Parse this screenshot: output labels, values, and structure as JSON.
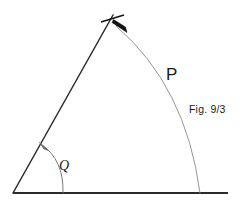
{
  "figure": {
    "caption": "Fig. 9/3",
    "labels": {
      "arc_label": "P",
      "angle_label": "Q"
    },
    "colors": {
      "background": "#ffffff",
      "baseline_stroke": "#2b2b2b",
      "slant_stroke": "#2b2b2b",
      "arc_stroke": "#8a8a8a",
      "angle_arc_stroke": "#6b6b6b",
      "marker_fill": "#111111",
      "text": "#1a1a1a"
    },
    "geometry": {
      "origin": {
        "x": 13,
        "y": 193
      },
      "apex": {
        "x": 113,
        "y": 15
      },
      "baseline_end": {
        "x": 228,
        "y": 193
      },
      "arc_start": {
        "x": 116,
        "y": 26
      },
      "arc_end": {
        "x": 200,
        "y": 193
      },
      "arc_control": {
        "x": 186,
        "y": 86
      },
      "angle_arc_start": {
        "x": 63,
        "y": 193
      },
      "angle_arc_end": {
        "x": 42,
        "y": 145
      },
      "angle_arc_control": {
        "x": 64,
        "y": 160
      },
      "apex_tick_start": {
        "x": 101,
        "y": 22
      },
      "apex_tick_end": {
        "x": 124,
        "y": 15
      },
      "apex_arrow_tip": {
        "x": 126,
        "y": 32
      },
      "angle_arrow_tip": {
        "x": 40,
        "y": 143
      }
    },
    "strokes": {
      "baseline_width": 2.1,
      "slant_width": 1.5,
      "arc_width": 0.9,
      "angle_arc_width": 0.9,
      "tick_width": 1.6
    }
  }
}
